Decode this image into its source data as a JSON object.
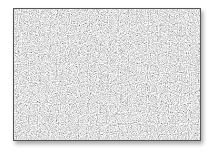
{
  "image": {
    "description": "noise texture",
    "border_color": "#555555",
    "base_color": "#d8d8d8",
    "noise_dark": "#6a6a6a",
    "noise_light": "#f4f4f4"
  }
}
